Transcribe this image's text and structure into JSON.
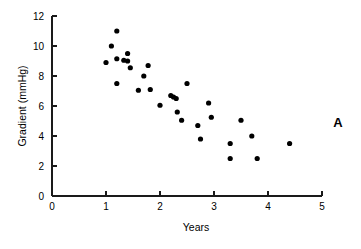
{
  "figure": {
    "panel_label": "A",
    "background_color": "#ffffff",
    "foreground_color": "#000000"
  },
  "chart_data": {
    "type": "scatter",
    "title": "",
    "xlabel": "Years",
    "ylabel": "Gradient (mmHg)",
    "xlim": [
      0,
      5
    ],
    "ylim": [
      0,
      12
    ],
    "xticks": [
      0,
      1,
      2,
      3,
      4,
      5
    ],
    "yticks": [
      0,
      2,
      4,
      6,
      8,
      10,
      12
    ],
    "xtick_labels": [
      "0",
      "1",
      "2",
      "3",
      "4",
      "5"
    ],
    "ytick_labels": [
      "0",
      "2",
      "4",
      "6",
      "8",
      "10",
      "12"
    ],
    "grid": false,
    "legend": false,
    "marker": "filled-circle",
    "marker_color": "#000000",
    "marker_size_px": 2.6,
    "annotations": [
      {
        "text": "A",
        "position": "outside-right"
      }
    ],
    "series": [
      {
        "name": "Gradient vs Years",
        "points": [
          {
            "x": 1.0,
            "y": 8.9
          },
          {
            "x": 1.1,
            "y": 10.0
          },
          {
            "x": 1.2,
            "y": 11.0
          },
          {
            "x": 1.2,
            "y": 9.15
          },
          {
            "x": 1.2,
            "y": 7.5
          },
          {
            "x": 1.33,
            "y": 9.05
          },
          {
            "x": 1.4,
            "y": 9.5
          },
          {
            "x": 1.4,
            "y": 9.0
          },
          {
            "x": 1.45,
            "y": 8.55
          },
          {
            "x": 1.6,
            "y": 7.05
          },
          {
            "x": 1.7,
            "y": 8.0
          },
          {
            "x": 1.78,
            "y": 8.7
          },
          {
            "x": 1.82,
            "y": 7.1
          },
          {
            "x": 2.0,
            "y": 6.05
          },
          {
            "x": 2.2,
            "y": 6.7
          },
          {
            "x": 2.25,
            "y": 6.6
          },
          {
            "x": 2.3,
            "y": 6.5
          },
          {
            "x": 2.32,
            "y": 5.6
          },
          {
            "x": 2.4,
            "y": 5.05
          },
          {
            "x": 2.5,
            "y": 7.5
          },
          {
            "x": 2.7,
            "y": 4.7
          },
          {
            "x": 2.75,
            "y": 3.8
          },
          {
            "x": 2.9,
            "y": 6.2
          },
          {
            "x": 2.95,
            "y": 5.25
          },
          {
            "x": 3.3,
            "y": 3.5
          },
          {
            "x": 3.3,
            "y": 2.5
          },
          {
            "x": 3.5,
            "y": 5.05
          },
          {
            "x": 3.7,
            "y": 4.0
          },
          {
            "x": 3.8,
            "y": 2.5
          },
          {
            "x": 4.4,
            "y": 3.5
          }
        ]
      }
    ]
  }
}
